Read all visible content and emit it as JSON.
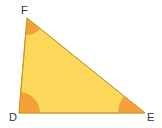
{
  "diagram": {
    "type": "triangle",
    "fill_color": "#fcd85a",
    "stroke_color": "#c79a2e",
    "angle_color": "#f4a238",
    "vertices": [
      {
        "label": "F",
        "x": 27,
        "y": 18
      },
      {
        "label": "D",
        "x": 19,
        "y": 113
      },
      {
        "label": "E",
        "x": 145,
        "y": 113
      }
    ],
    "angle_marks": [
      "F",
      "D",
      "E"
    ]
  }
}
